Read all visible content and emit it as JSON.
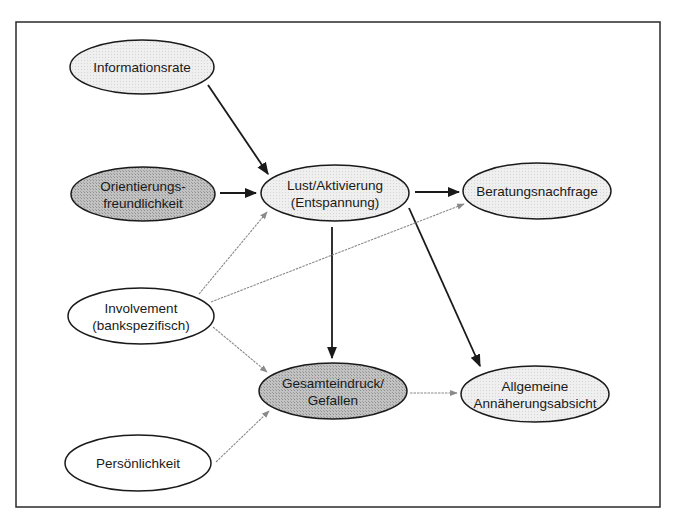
{
  "diagram": {
    "frame": {
      "x": 16,
      "y": 22,
      "width": 644,
      "height": 485,
      "stroke": "#2a2a2a"
    },
    "colors": {
      "light_fill": "#ececec",
      "dark_fill": "#b8b8b8",
      "white_fill": "#ffffff",
      "node_stroke": "#1a1a1a",
      "strong_edge": "#1a1a1a",
      "weak_edge": "#8a8a8a"
    },
    "nodes": [
      {
        "id": "informationsrate",
        "lines": [
          "Informationsrate"
        ],
        "cx": 142,
        "cy": 67,
        "rx": 72,
        "ry": 27,
        "fill": "light"
      },
      {
        "id": "orientierungsfreundlichkeit",
        "lines": [
          "Orientierungs-",
          "freundlichkeit"
        ],
        "cx": 143,
        "cy": 194,
        "rx": 72,
        "ry": 27,
        "fill": "dark"
      },
      {
        "id": "lust-aktivierung",
        "lines": [
          "Lust/Aktivierung",
          "(Entspannung)"
        ],
        "cx": 335,
        "cy": 193,
        "rx": 74,
        "ry": 28,
        "fill": "light"
      },
      {
        "id": "beratungsnachfrage",
        "lines": [
          "Beratungsnachfrage"
        ],
        "cx": 537,
        "cy": 191,
        "rx": 74,
        "ry": 28,
        "fill": "light"
      },
      {
        "id": "involvement",
        "lines": [
          "Involvement",
          "(bankspezifisch)"
        ],
        "cx": 141,
        "cy": 316,
        "rx": 73,
        "ry": 28,
        "fill": "white"
      },
      {
        "id": "gesamteindruck",
        "lines": [
          "Gesamteindruck/",
          "Gefallen"
        ],
        "cx": 333,
        "cy": 391,
        "rx": 74,
        "ry": 28,
        "fill": "dark"
      },
      {
        "id": "allgemeine-annaeherungsabsicht",
        "lines": [
          "Allgemeine",
          "Annäherungsabsicht"
        ],
        "cx": 535,
        "cy": 394,
        "rx": 74,
        "ry": 28,
        "fill": "light"
      },
      {
        "id": "persoenlichkeit",
        "lines": [
          "Persönlichkeit"
        ],
        "cx": 138,
        "cy": 463,
        "rx": 73,
        "ry": 28,
        "fill": "white"
      }
    ],
    "edges": [
      {
        "from": "informationsrate",
        "to": "lust-aktivierung",
        "x1": 208,
        "y1": 85,
        "x2": 268,
        "y2": 174,
        "style": "strong"
      },
      {
        "from": "orientierungsfreundlichkeit",
        "to": "lust-aktivierung",
        "x1": 220,
        "y1": 193,
        "x2": 256,
        "y2": 193,
        "style": "strong"
      },
      {
        "from": "lust-aktivierung",
        "to": "beratungsnachfrage",
        "x1": 415,
        "y1": 192,
        "x2": 459,
        "y2": 192,
        "style": "strong"
      },
      {
        "from": "lust-aktivierung",
        "to": "gesamteindruck",
        "x1": 332,
        "y1": 227,
        "x2": 332,
        "y2": 358,
        "style": "strong"
      },
      {
        "from": "lust-aktivierung",
        "to": "allgemeine-annaeherungsabsicht",
        "x1": 409,
        "y1": 208,
        "x2": 480,
        "y2": 366,
        "style": "strong"
      },
      {
        "from": "involvement",
        "to": "lust-aktivierung",
        "x1": 199,
        "y1": 294,
        "x2": 267,
        "y2": 212,
        "style": "weak"
      },
      {
        "from": "involvement",
        "to": "beratungsnachfrage",
        "x1": 211,
        "y1": 302,
        "x2": 464,
        "y2": 204,
        "style": "weak"
      },
      {
        "from": "involvement",
        "to": "gesamteindruck",
        "x1": 213,
        "y1": 327,
        "x2": 267,
        "y2": 372,
        "style": "weak"
      },
      {
        "from": "persoenlichkeit",
        "to": "gesamteindruck",
        "x1": 216,
        "y1": 462,
        "x2": 269,
        "y2": 411,
        "style": "weak"
      },
      {
        "from": "gesamteindruck",
        "to": "allgemeine-annaeherungsabsicht",
        "x1": 410,
        "y1": 393,
        "x2": 457,
        "y2": 393,
        "style": "weak"
      }
    ]
  }
}
